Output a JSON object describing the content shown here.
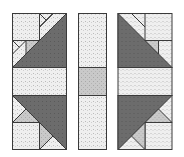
{
  "figure": {
    "colors": {
      "background": "#ffffff",
      "light_fabric": "#ededed",
      "medium_fabric": "#c4c4c4",
      "dark_fabric": "#6a6a6a",
      "outline": "#3a3a3a"
    },
    "panels": [
      {
        "name": "left-panel"
      },
      {
        "name": "center-strip"
      },
      {
        "name": "right-panel"
      }
    ]
  }
}
